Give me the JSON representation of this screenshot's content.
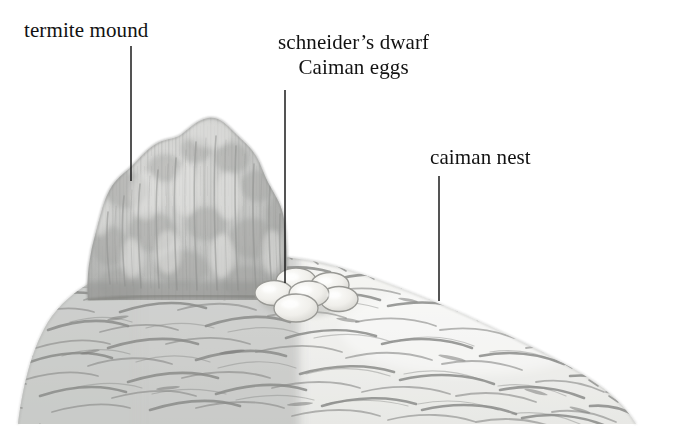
{
  "figure": {
    "width": 679,
    "height": 443,
    "background": "#ffffff",
    "ink_color": "#121212",
    "style": "pencil-and-wash scientific illustration, greyscale"
  },
  "labels": {
    "termite_mound": "termite mound",
    "eggs_line1": "schneider’s dwarf",
    "eggs_line2": "Caiman eggs",
    "caiman_nest": "caiman nest"
  },
  "leader_lines": [
    {
      "name": "leader-termite-mound",
      "x1": 131,
      "y1": 46,
      "x2": 131,
      "y2": 181
    },
    {
      "name": "leader-eggs",
      "x1": 285,
      "y1": 90,
      "x2": 285,
      "y2": 283
    },
    {
      "name": "leader-caiman-nest",
      "x1": 439,
      "y1": 176,
      "x2": 439,
      "y2": 301
    }
  ],
  "elements": {
    "termite_mound": {
      "name": "termite-mound",
      "fill": "#c5c6c4",
      "shadow": "#a9aaa8",
      "peak_x": 215,
      "peak_y": 118,
      "base_y": 300,
      "left_x": 88,
      "right_x": 287
    },
    "caiman_nest": {
      "name": "caiman-nest-mound",
      "fill": "#ececeb",
      "stroke": "#8e8f8d",
      "crest_x": 300,
      "crest_y": 258,
      "left_x": 18,
      "right_x": 636,
      "base_y": 424,
      "shadow_band": "#bdbebc"
    },
    "eggs": {
      "name": "caiman-egg-cluster",
      "count": 6,
      "fill": "#f4f3ef",
      "stroke": "#9a9a98",
      "center_x": 303,
      "center_y": 292,
      "egg_rx": 20,
      "egg_ry": 13
    }
  },
  "colors": {
    "ink": "#121212",
    "mound_grey": "#c5c6c4",
    "mound_shade": "#a9aaa8",
    "litter_light": "#ececea",
    "litter_stroke": "#909190",
    "egg_highlight": "#fbfaf7"
  }
}
